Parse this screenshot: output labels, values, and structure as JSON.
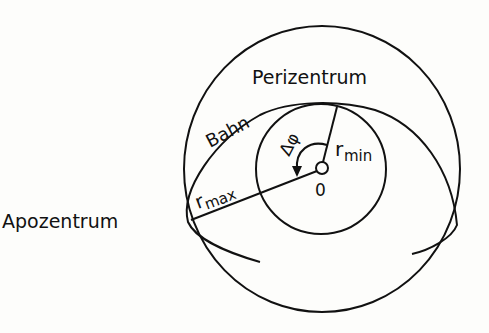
{
  "diagram": {
    "title_labels": {
      "perizentrum": "Perizentrum",
      "apozentrum": "Apozentrum",
      "bahn": "Bahn",
      "r_max_base": "r",
      "r_max_sub": "max",
      "r_min_base": "r",
      "r_min_sub": "min",
      "delta_phi": "Δφ",
      "origin": "0"
    },
    "colors": {
      "background": "#fdfdfb",
      "stroke": "#111111"
    }
  }
}
